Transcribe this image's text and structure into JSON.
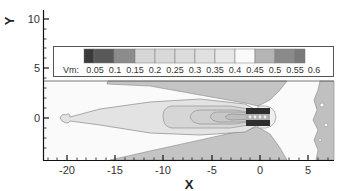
{
  "chart_data": {
    "type": "heatmap",
    "subtype": "filled-contour",
    "title": "",
    "xlabel": "X",
    "ylabel": "Y",
    "xlim": [
      -22.5,
      7.5
    ],
    "ylim": [
      -4.3,
      11.2
    ],
    "x_ticks": [
      -20,
      -15,
      -10,
      -5,
      0,
      5
    ],
    "y_ticks": [
      0,
      5,
      10
    ],
    "x_tick_labels": [
      "-20",
      "-15",
      "-10",
      "-5",
      "0",
      "5"
    ],
    "y_tick_labels": [
      "0",
      "5",
      "10"
    ],
    "grid": false,
    "legend": {
      "title": "Vm:",
      "position": "top, inside upper portion of axes",
      "levels": [
        0.05,
        0.1,
        0.15,
        0.2,
        0.25,
        0.3,
        0.35,
        0.4,
        0.45,
        0.5,
        0.55,
        0.6
      ],
      "level_labels": [
        "0.05",
        "0.1",
        "0.15",
        "0.2",
        "0.25",
        "0.3",
        "0.35",
        "0.4",
        "0.45",
        "0.5",
        "0.55",
        "0.6"
      ],
      "colors": [
        "#3a3a3a",
        "#595959",
        "#8c8c8c",
        "#d6d6d6",
        "#d9d9d9",
        "#dcdcdc",
        "#e0e0e0",
        "#e8e8e8",
        "#fafafa",
        "#b5b5b5",
        "#8a8a8a",
        "#7a7a7a"
      ]
    },
    "data_region": {
      "y_top": 3.6,
      "description": "Velocity magnitude field: wake extends leftward from body near x=0, y=0; low-velocity plume spreads to x≈-21; white (≈0.45) free-stream region on the right; gray wedges above and below the body"
    }
  },
  "labels": {
    "x_axis_title": "X",
    "y_axis_title": "Y",
    "legend_title": "Vm:"
  }
}
